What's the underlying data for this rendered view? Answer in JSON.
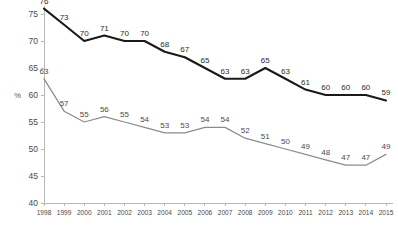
{
  "chart_data": {
    "type": "line",
    "title": "",
    "subtitle": "",
    "xlabel": "",
    "ylabel": "%",
    "ylim": [
      40,
      75
    ],
    "yticks": [
      40,
      45,
      50,
      55,
      60,
      65,
      70,
      75
    ],
    "grid": false,
    "legend": "none",
    "categories": [
      "1998",
      "1999",
      "2000",
      "2001",
      "2002",
      "2003",
      "2004",
      "2005",
      "2006",
      "2007",
      "2008",
      "2009",
      "2010",
      "2011",
      "2012",
      "2013",
      "2014",
      "2015"
    ],
    "series": [
      {
        "name": "primary",
        "color": "#1a1a1a",
        "values": [
          76,
          73,
          70,
          71,
          70,
          70,
          68,
          67,
          65,
          63,
          63,
          65,
          63,
          61,
          60,
          60,
          60,
          59
        ],
        "labels": [
          "76",
          "73",
          "70",
          "71",
          "70",
          "70",
          "68",
          "67",
          "65",
          "63",
          "63",
          "65",
          "63",
          "61",
          "60",
          "60",
          "60",
          "59"
        ]
      },
      {
        "name": "secondary",
        "color": "#8c8c8c",
        "values": [
          63,
          57,
          55,
          56,
          55,
          54,
          53,
          53,
          54,
          54,
          52,
          51,
          50,
          49,
          48,
          47,
          47,
          49
        ],
        "labels": [
          "63",
          "57",
          "55",
          "56",
          "55",
          "54",
          "53",
          "53",
          "54",
          "54",
          "52",
          "51",
          "50",
          "49",
          "48",
          "47",
          "47",
          "49"
        ]
      }
    ]
  },
  "axis": {
    "unit_label": "%",
    "y_tick_labels": [
      "75",
      "70",
      "65",
      "60",
      "55",
      "50",
      "45",
      "40"
    ],
    "x_tick_labels": [
      "1998",
      "1999",
      "2000",
      "2001",
      "2002",
      "2003",
      "2004",
      "2005",
      "2006",
      "2007",
      "2008",
      "2009",
      "2010",
      "2011",
      "2012",
      "2013",
      "2014",
      "2015"
    ]
  },
  "colors": {
    "primary_series": "#1a1a1a",
    "secondary_series": "#8c8c8c",
    "axis": "#b9b9b9",
    "label_text": "#2b2b2b",
    "background": "#ffffff"
  }
}
